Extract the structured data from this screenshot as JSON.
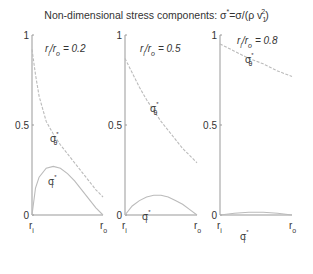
{
  "title": {
    "main": "Non-dimensional stress components: ",
    "formula": "σ*=σ/(ρ v₁²)",
    "sigma": "σ",
    "star": "*",
    "eq": "=σ/(ρ v",
    "sub": "1",
    "sup": "2",
    "close": ")"
  },
  "colors": {
    "axis": "#999999",
    "curve": "#bbbbbb",
    "text": "#333333"
  },
  "chart_data": [
    {
      "type": "line",
      "panel_label": "r_i/r_o = 0.2",
      "ratio_text": "= 0.2",
      "ratio": 0.2,
      "xlabel_ticks": [
        "r_i",
        "r_o"
      ],
      "ytick_labels": [
        "0",
        "0.5",
        "1"
      ],
      "ylim": [
        0,
        1
      ],
      "grid": false,
      "series": [
        {
          "name": "σθ*",
          "style": "dashed",
          "x": [
            0,
            0.05,
            0.1,
            0.2,
            0.3,
            0.4,
            0.5,
            0.6,
            0.7,
            0.8,
            0.9,
            1.0
          ],
          "values": [
            0.92,
            0.78,
            0.66,
            0.52,
            0.45,
            0.39,
            0.34,
            0.29,
            0.24,
            0.19,
            0.14,
            0.1
          ]
        },
        {
          "name": "σr*",
          "style": "solid",
          "x": [
            0,
            0.05,
            0.1,
            0.2,
            0.3,
            0.4,
            0.5,
            0.6,
            0.7,
            0.8,
            0.9,
            1.0
          ],
          "values": [
            0,
            0.15,
            0.21,
            0.26,
            0.27,
            0.26,
            0.23,
            0.19,
            0.14,
            0.09,
            0.04,
            0
          ]
        }
      ]
    },
    {
      "type": "line",
      "panel_label": "r_i/r_o = 0.5",
      "ratio_text": "= 0.5",
      "ratio": 0.5,
      "xlabel_ticks": [
        "r_i",
        "r_o"
      ],
      "ytick_labels": [
        "0",
        "0.5",
        "1"
      ],
      "ylim": [
        0,
        1
      ],
      "grid": false,
      "series": [
        {
          "name": "σθ*",
          "style": "dashed",
          "x": [
            0,
            0.1,
            0.2,
            0.3,
            0.4,
            0.5,
            0.6,
            0.7,
            0.8,
            0.9,
            1.0
          ],
          "values": [
            0.87,
            0.79,
            0.71,
            0.64,
            0.58,
            0.52,
            0.47,
            0.42,
            0.37,
            0.33,
            0.29
          ]
        },
        {
          "name": "σr*",
          "style": "solid",
          "x": [
            0,
            0.1,
            0.2,
            0.3,
            0.4,
            0.5,
            0.6,
            0.7,
            0.8,
            0.9,
            1.0
          ],
          "values": [
            0,
            0.05,
            0.08,
            0.1,
            0.11,
            0.11,
            0.1,
            0.08,
            0.06,
            0.03,
            0
          ]
        }
      ]
    },
    {
      "type": "line",
      "panel_label": "r_i/r_o = 0.8",
      "ratio_text": "= 0.8",
      "ratio": 0.8,
      "xlabel_ticks": [
        "r_i",
        "r_o"
      ],
      "ytick_labels": [
        "0",
        "0.5",
        "1"
      ],
      "ylim": [
        0,
        1
      ],
      "grid": false,
      "series": [
        {
          "name": "σθ*",
          "style": "dashed",
          "x": [
            0,
            0.2,
            0.4,
            0.6,
            0.8,
            1.0
          ],
          "values": [
            0.95,
            0.91,
            0.87,
            0.84,
            0.8,
            0.77
          ]
        },
        {
          "name": "σr*",
          "style": "solid",
          "x": [
            0,
            0.2,
            0.4,
            0.6,
            0.8,
            1.0
          ],
          "values": [
            0,
            0.01,
            0.015,
            0.015,
            0.01,
            0
          ]
        }
      ]
    }
  ]
}
